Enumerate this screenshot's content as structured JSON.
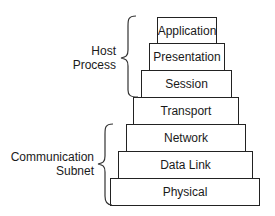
{
  "diagram": {
    "layers": [
      {
        "name": "Application"
      },
      {
        "name": "Presentation"
      },
      {
        "name": "Session"
      },
      {
        "name": "Transport"
      },
      {
        "name": "Network"
      },
      {
        "name": "Data Link"
      },
      {
        "name": "Physical"
      }
    ],
    "groups": {
      "host": {
        "line1": "Host",
        "line2": "Process"
      },
      "subnet": {
        "line1": "Communication",
        "line2": "Subnet"
      }
    }
  }
}
